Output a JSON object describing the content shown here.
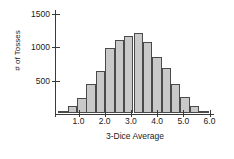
{
  "chart_data": {
    "type": "bar",
    "title": "",
    "subtitle": "",
    "xlabel": "3-Dice Average",
    "ylabel": "# of Tosses",
    "xlim": [
      0.72,
      6.39
    ],
    "ylim": [
      0,
      1620
    ],
    "grid": false,
    "legend": null,
    "bin_width": 0.3333,
    "y_ticks": [
      500,
      1000,
      1500
    ],
    "y_tick_labels": [
      "500",
      "1000",
      "1500"
    ],
    "x_ticks": [
      1.0,
      2.0,
      3.0,
      4.0,
      5.0,
      6.0
    ],
    "x_tick_labels": [
      "1.0",
      "2.0",
      "3.0",
      "4.0",
      "5.0",
      "6.0"
    ],
    "bar_fill_color": "#c9c9c9",
    "bar_edge_color": "#4a4a4a",
    "axis_color": "#3a3a3a",
    "categories": [
      "1.00",
      "1.33",
      "1.67",
      "2.00",
      "2.33",
      "2.67",
      "3.00",
      "3.33",
      "3.67",
      "4.00",
      "4.33",
      "4.67",
      "5.00",
      "5.33",
      "5.67",
      "6.00"
    ],
    "values": [
      30,
      110,
      245,
      455,
      660,
      1015,
      1140,
      1205,
      1245,
      1120,
      880,
      700,
      455,
      250,
      110,
      30
    ]
  }
}
